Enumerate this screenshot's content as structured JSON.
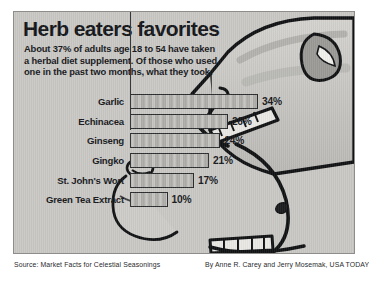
{
  "graphic": {
    "title": "Herb eaters favorites",
    "deck": "About 37% of adults age 18 to 54 have taken a herbal diet supplement. Of those who used one in the past two months, what they took:",
    "source": "Source: Market Facts for Celestial Seasonings",
    "byline": "By Anne R. Carey and Jerry Mosemak, USA TODAY",
    "panel_color": "#c9c8c4",
    "bar_color": "#b6b5b1",
    "ink_color": "#17181c"
  },
  "illustration": {
    "subject": "cartoon-face-profile-eating-bars",
    "parts": [
      "head-outline",
      "open-mouth",
      "upper-teeth",
      "lower-teeth",
      "nose",
      "eye",
      "chin",
      "hand-holding-bars"
    ]
  },
  "chart_data": {
    "type": "bar",
    "orientation": "horizontal",
    "title": "Herb eaters favorites",
    "subtitle": "About 37% of adults age 18 to 54 have taken a herbal diet supplement. Of those who used one in the past two months, what they took:",
    "categories": [
      "Garlic",
      "Echinacea",
      "Ginseng",
      "Gingko",
      "St. John's Wort",
      "Green Tea Extract"
    ],
    "values": [
      34,
      26,
      24,
      21,
      17,
      10
    ],
    "value_labels": [
      "34%",
      "26%",
      "24%",
      "21%",
      "17%",
      "10%"
    ],
    "unit": "%",
    "xlabel": "",
    "ylabel": "",
    "xlim": [
      0,
      34
    ],
    "grid": false,
    "legend": false,
    "source": "Market Facts for Celestial Seasonings"
  }
}
